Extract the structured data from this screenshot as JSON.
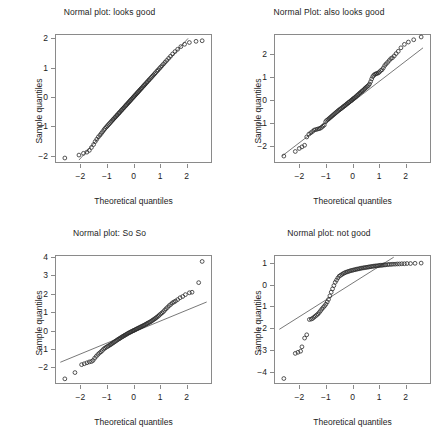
{
  "figure": {
    "background": "#ffffff",
    "point_color": "#2b2b2b",
    "line_color": "#555555",
    "frame_color": "#8a8a8a"
  },
  "chart_data": [
    {
      "type": "scatter",
      "panel": "top-left",
      "title": "Normal plot: looks good",
      "xlabel": "Theoretical quantiles",
      "ylabel": "Sample quantiles",
      "xlim": [
        -2.95,
        2.95
      ],
      "ylim": [
        -2.25,
        2.15
      ],
      "xticks": [
        -2,
        -1,
        0,
        1,
        2
      ],
      "yticks": [
        -2,
        -1,
        0,
        1,
        2
      ],
      "xticklabels": [
        "-2",
        "-1",
        "0",
        "1",
        "2"
      ],
      "yticklabels": [
        "-2",
        "-1",
        "0",
        "1",
        "2"
      ],
      "grid": false,
      "legend": "none",
      "refline": {
        "x": [
          -2.05,
          2.05
        ],
        "y": [
          -2.15,
          2.0
        ]
      },
      "x": [
        -2.58,
        -2.05,
        -1.88,
        -1.75,
        -1.66,
        -1.58,
        -1.5,
        -1.44,
        -1.38,
        -1.32,
        -1.26,
        -1.21,
        -1.16,
        -1.11,
        -1.07,
        -1.02,
        -0.98,
        -0.94,
        -0.9,
        -0.86,
        -0.82,
        -0.78,
        -0.75,
        -0.71,
        -0.68,
        -0.64,
        -0.61,
        -0.57,
        -0.54,
        -0.51,
        -0.47,
        -0.44,
        -0.41,
        -0.38,
        -0.35,
        -0.31,
        -0.28,
        -0.25,
        -0.22,
        -0.19,
        -0.16,
        -0.13,
        -0.1,
        -0.07,
        -0.04,
        -0.01,
        0.02,
        0.05,
        0.08,
        0.11,
        0.14,
        0.17,
        0.2,
        0.23,
        0.26,
        0.29,
        0.32,
        0.36,
        0.39,
        0.42,
        0.45,
        0.49,
        0.52,
        0.56,
        0.59,
        0.63,
        0.67,
        0.71,
        0.75,
        0.79,
        0.83,
        0.88,
        0.92,
        0.97,
        1.02,
        1.07,
        1.13,
        1.19,
        1.25,
        1.32,
        1.39,
        1.47,
        1.56,
        1.66,
        1.78,
        1.92,
        2.1,
        2.35,
        2.58
      ],
      "y": [
        -2.08,
        -1.98,
        -1.92,
        -1.88,
        -1.82,
        -1.72,
        -1.62,
        -1.52,
        -1.44,
        -1.36,
        -1.3,
        -1.24,
        -1.18,
        -1.12,
        -1.07,
        -1.02,
        -0.98,
        -0.94,
        -0.9,
        -0.86,
        -0.82,
        -0.78,
        -0.75,
        -0.71,
        -0.68,
        -0.64,
        -0.61,
        -0.57,
        -0.54,
        -0.51,
        -0.47,
        -0.44,
        -0.41,
        -0.38,
        -0.35,
        -0.31,
        -0.28,
        -0.25,
        -0.22,
        -0.19,
        -0.16,
        -0.13,
        -0.1,
        -0.07,
        -0.04,
        -0.01,
        0.02,
        0.05,
        0.08,
        0.11,
        0.14,
        0.17,
        0.2,
        0.23,
        0.26,
        0.29,
        0.32,
        0.36,
        0.39,
        0.42,
        0.45,
        0.49,
        0.52,
        0.56,
        0.59,
        0.63,
        0.67,
        0.71,
        0.75,
        0.79,
        0.83,
        0.88,
        0.92,
        0.97,
        1.02,
        1.07,
        1.13,
        1.19,
        1.25,
        1.32,
        1.39,
        1.47,
        1.55,
        1.63,
        1.72,
        1.8,
        1.86,
        1.9,
        1.92
      ]
    },
    {
      "type": "scatter",
      "panel": "top-right",
      "title": "Normal Plot: also looks good",
      "xlabel": "Theoretical quantiles",
      "ylabel": "Sample quantiles",
      "xlim": [
        -2.95,
        2.95
      ],
      "ylim": [
        -2.75,
        2.85
      ],
      "xticks": [
        -2,
        -1,
        0,
        1,
        2
      ],
      "yticks": [
        -2,
        -1,
        0,
        1,
        2
      ],
      "xticklabels": [
        "-2",
        "-1",
        "0",
        "1",
        "2"
      ],
      "yticklabels": [
        "-2",
        "-1",
        "0",
        "1",
        "2"
      ],
      "grid": false,
      "legend": "none",
      "refline": {
        "x": [
          -2.65,
          2.65
        ],
        "y": [
          -2.45,
          2.25
        ]
      },
      "x": [
        -2.58,
        -2.15,
        -2.0,
        -1.9,
        -1.8,
        -1.72,
        -1.64,
        -1.57,
        -1.5,
        -1.44,
        -1.38,
        -1.32,
        -1.26,
        -1.21,
        -1.16,
        -1.11,
        -1.06,
        -1.01,
        -0.97,
        -0.92,
        -0.88,
        -0.84,
        -0.8,
        -0.76,
        -0.72,
        -0.68,
        -0.64,
        -0.6,
        -0.56,
        -0.52,
        -0.48,
        -0.45,
        -0.41,
        -0.37,
        -0.34,
        -0.3,
        -0.27,
        -0.23,
        -0.2,
        -0.16,
        -0.13,
        -0.1,
        -0.06,
        -0.03,
        0.0,
        0.03,
        0.06,
        0.1,
        0.13,
        0.16,
        0.2,
        0.23,
        0.27,
        0.3,
        0.34,
        0.37,
        0.41,
        0.45,
        0.48,
        0.52,
        0.56,
        0.6,
        0.64,
        0.68,
        0.72,
        0.76,
        0.8,
        0.84,
        0.88,
        0.92,
        0.97,
        1.01,
        1.06,
        1.11,
        1.16,
        1.21,
        1.26,
        1.32,
        1.38,
        1.44,
        1.5,
        1.57,
        1.64,
        1.72,
        1.82,
        1.95,
        2.1,
        2.3,
        2.58
      ],
      "y": [
        -2.45,
        -2.25,
        -2.12,
        -2.05,
        -1.98,
        -1.62,
        -1.5,
        -1.44,
        -1.38,
        -1.32,
        -1.3,
        -1.28,
        -1.26,
        -1.24,
        -1.2,
        -1.15,
        -1.1,
        -0.96,
        -0.9,
        -0.86,
        -0.82,
        -0.78,
        -0.74,
        -0.7,
        -0.66,
        -0.62,
        -0.58,
        -0.54,
        -0.5,
        -0.46,
        -0.43,
        -0.4,
        -0.37,
        -0.33,
        -0.3,
        -0.27,
        -0.24,
        -0.2,
        -0.17,
        -0.14,
        -0.11,
        -0.08,
        -0.05,
        -0.02,
        0.01,
        0.04,
        0.07,
        0.1,
        0.13,
        0.17,
        0.2,
        0.24,
        0.28,
        0.31,
        0.35,
        0.38,
        0.42,
        0.46,
        0.5,
        0.54,
        0.58,
        0.62,
        0.68,
        0.78,
        0.9,
        1.0,
        1.06,
        1.1,
        1.12,
        1.14,
        1.16,
        1.2,
        1.26,
        1.3,
        1.38,
        1.48,
        1.55,
        1.62,
        1.7,
        1.78,
        1.82,
        1.9,
        2.0,
        2.1,
        2.25,
        2.4,
        2.5,
        2.6,
        2.72
      ]
    },
    {
      "type": "scatter",
      "panel": "bottom-left",
      "title": "Normal plot: So So",
      "xlabel": "Theoretical quantiles",
      "ylabel": "Sample quantiles",
      "xlim": [
        -2.95,
        2.95
      ],
      "ylim": [
        -2.9,
        4.1
      ],
      "xticks": [
        -2,
        -1,
        0,
        1,
        2
      ],
      "yticks": [
        -2,
        -1,
        0,
        1,
        2,
        3,
        4
      ],
      "xticklabels": [
        "-2",
        "-1",
        "0",
        "1",
        "2"
      ],
      "yticklabels": [
        "-2",
        "-1",
        "0",
        "1",
        "2",
        "3",
        "4"
      ],
      "grid": false,
      "legend": "none",
      "refline": {
        "x": [
          -2.75,
          2.75
        ],
        "y": [
          -1.72,
          1.55
        ]
      },
      "x": [
        -2.58,
        -2.2,
        -1.95,
        -1.85,
        -1.75,
        -1.66,
        -1.58,
        -1.52,
        -1.46,
        -1.4,
        -1.34,
        -1.28,
        -1.22,
        -1.17,
        -1.12,
        -1.07,
        -1.02,
        -0.97,
        -0.93,
        -0.88,
        -0.84,
        -0.8,
        -0.76,
        -0.72,
        -0.68,
        -0.64,
        -0.6,
        -0.56,
        -0.52,
        -0.49,
        -0.45,
        -0.41,
        -0.38,
        -0.34,
        -0.31,
        -0.27,
        -0.24,
        -0.2,
        -0.17,
        -0.13,
        -0.1,
        -0.07,
        -0.03,
        0.0,
        0.03,
        0.07,
        0.1,
        0.13,
        0.17,
        0.2,
        0.24,
        0.27,
        0.31,
        0.34,
        0.38,
        0.41,
        0.45,
        0.49,
        0.52,
        0.56,
        0.6,
        0.64,
        0.68,
        0.72,
        0.76,
        0.8,
        0.84,
        0.88,
        0.93,
        0.97,
        1.02,
        1.07,
        1.12,
        1.17,
        1.22,
        1.28,
        1.34,
        1.4,
        1.46,
        1.52,
        1.58,
        1.66,
        1.75,
        1.85,
        1.95,
        2.1,
        2.2,
        2.45,
        2.58
      ],
      "y": [
        -2.62,
        -2.28,
        -1.85,
        -1.8,
        -1.75,
        -1.7,
        -1.68,
        -1.62,
        -1.5,
        -1.4,
        -1.3,
        -1.22,
        -1.15,
        -1.08,
        -1.0,
        -0.95,
        -0.9,
        -0.86,
        -0.82,
        -0.78,
        -0.74,
        -0.7,
        -0.66,
        -0.62,
        -0.58,
        -0.54,
        -0.5,
        -0.46,
        -0.43,
        -0.4,
        -0.36,
        -0.33,
        -0.3,
        -0.27,
        -0.24,
        -0.21,
        -0.18,
        -0.15,
        -0.12,
        -0.1,
        -0.07,
        -0.05,
        -0.02,
        0.0,
        0.02,
        0.05,
        0.07,
        0.1,
        0.12,
        0.15,
        0.17,
        0.2,
        0.22,
        0.25,
        0.27,
        0.3,
        0.33,
        0.36,
        0.39,
        0.42,
        0.45,
        0.48,
        0.52,
        0.56,
        0.6,
        0.64,
        0.68,
        0.73,
        0.78,
        0.84,
        0.9,
        0.96,
        1.02,
        1.1,
        1.18,
        1.26,
        1.35,
        1.42,
        1.5,
        1.55,
        1.6,
        1.68,
        1.78,
        1.85,
        1.95,
        2.05,
        2.08,
        2.6,
        3.75
      ]
    },
    {
      "type": "scatter",
      "panel": "bottom-right",
      "title": "Normal plot: not good",
      "xlabel": "Theoretical quantiles",
      "ylabel": "Sample quantiles",
      "xlim": [
        -2.95,
        2.95
      ],
      "ylim": [
        -4.55,
        1.35
      ],
      "xticks": [
        -2,
        -1,
        0,
        1,
        2
      ],
      "yticks": [
        -4,
        -3,
        -2,
        -1,
        0,
        1
      ],
      "xticklabels": [
        "-2",
        "-1",
        "0",
        "1",
        "2"
      ],
      "yticklabels": [
        "-4",
        "-3",
        "-2",
        "-1",
        "0",
        "1"
      ],
      "grid": false,
      "legend": "none",
      "refline": {
        "x": [
          -2.75,
          1.55
        ],
        "y": [
          -2.05,
          1.25
        ]
      },
      "x": [
        -2.58,
        -2.15,
        -2.05,
        -1.95,
        -1.9,
        -1.8,
        -1.72,
        -1.62,
        -1.55,
        -1.5,
        -1.45,
        -1.4,
        -1.35,
        -1.3,
        -1.25,
        -1.2,
        -1.15,
        -1.1,
        -1.05,
        -1.0,
        -0.95,
        -0.9,
        -0.85,
        -0.8,
        -0.75,
        -0.7,
        -0.65,
        -0.6,
        -0.55,
        -0.5,
        -0.45,
        -0.4,
        -0.35,
        -0.3,
        -0.25,
        -0.2,
        -0.15,
        -0.1,
        -0.05,
        0.0,
        0.05,
        0.1,
        0.15,
        0.2,
        0.25,
        0.3,
        0.35,
        0.4,
        0.45,
        0.5,
        0.55,
        0.6,
        0.65,
        0.7,
        0.75,
        0.8,
        0.85,
        0.9,
        0.95,
        1.0,
        1.05,
        1.1,
        1.15,
        1.2,
        1.25,
        1.32,
        1.38,
        1.45,
        1.52,
        1.6,
        1.68,
        1.76,
        1.85,
        1.95,
        2.05,
        2.18,
        2.35,
        2.58
      ],
      "y": [
        -4.3,
        -3.15,
        -3.1,
        -3.05,
        -2.85,
        -2.45,
        -2.3,
        -1.6,
        -1.58,
        -1.55,
        -1.5,
        -1.45,
        -1.4,
        -1.35,
        -1.28,
        -1.2,
        -1.12,
        -1.05,
        -0.98,
        -0.9,
        -0.8,
        -0.68,
        -0.52,
        -0.35,
        -0.2,
        -0.05,
        0.1,
        0.2,
        0.3,
        0.38,
        0.42,
        0.46,
        0.5,
        0.53,
        0.56,
        0.58,
        0.6,
        0.62,
        0.64,
        0.65,
        0.67,
        0.68,
        0.7,
        0.71,
        0.72,
        0.74,
        0.75,
        0.76,
        0.77,
        0.78,
        0.79,
        0.8,
        0.81,
        0.82,
        0.83,
        0.84,
        0.85,
        0.85,
        0.86,
        0.87,
        0.88,
        0.88,
        0.89,
        0.9,
        0.9,
        0.91,
        0.92,
        0.92,
        0.93,
        0.93,
        0.94,
        0.94,
        0.95,
        0.95,
        0.96,
        0.96,
        0.97,
        0.98
      ]
    }
  ]
}
